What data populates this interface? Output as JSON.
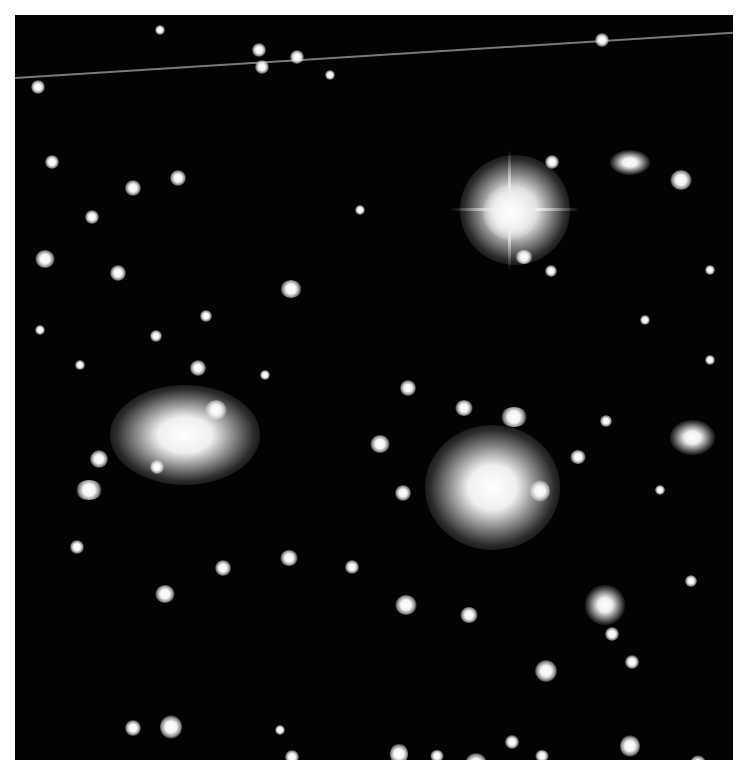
{
  "image": {
    "description": "Black-and-white astronomical photograph of a galaxy cluster with a bright foreground star",
    "colors": {
      "background": "#030303",
      "border": "#ffffff",
      "objects": "#ffffff"
    }
  },
  "objects": {
    "bright_star": {
      "x": 510,
      "y": 210,
      "r": 30
    },
    "galaxy_left": {
      "x": 180,
      "y": 430,
      "rx": 65,
      "ry": 45
    },
    "galaxy_center": {
      "x": 485,
      "y": 480,
      "rx": 60,
      "ry": 55
    },
    "satellite_trail": {
      "x1": 15,
      "y1": 77,
      "x2": 733,
      "y2": 32
    }
  }
}
